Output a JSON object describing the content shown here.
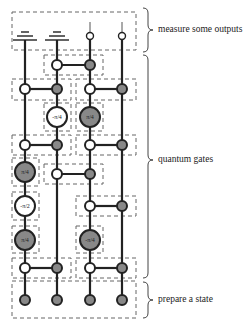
{
  "labels": {
    "measure": "measure some outputs",
    "gates": "quantum gates",
    "prepare": "prepare a state"
  },
  "gate_params": {
    "g1": "-π/4",
    "g2": "π/4",
    "g3": "π/4",
    "g4": "-π/2",
    "g5": "π/4",
    "g6": "-π/4"
  },
  "colors": {
    "wire": "#222222",
    "control_fill": "#ffffff",
    "target_fill": "#888888",
    "box_stroke": "#666666"
  },
  "wires_x": [
    25,
    57,
    90,
    122
  ]
}
